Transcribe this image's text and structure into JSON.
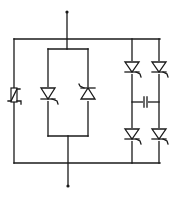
{
  "diagram": {
    "type": "circuit-schematic",
    "colors": {
      "line": "#1a1a1a",
      "background": "#ffffff"
    },
    "components": [
      {
        "id": "terminal-top",
        "kind": "terminal"
      },
      {
        "id": "terminal-bottom",
        "kind": "terminal"
      },
      {
        "id": "varistor",
        "kind": "varistor",
        "location": "left branch"
      },
      {
        "id": "thyristor-left",
        "kind": "thyristor",
        "orientation": "down"
      },
      {
        "id": "thyristor-right",
        "kind": "thyristor",
        "orientation": "up"
      },
      {
        "id": "bridge-thyristor-top-left",
        "kind": "thyristor",
        "orientation": "down"
      },
      {
        "id": "bridge-thyristor-top-right",
        "kind": "thyristor",
        "orientation": "down"
      },
      {
        "id": "bridge-thyristor-bottom-left",
        "kind": "thyristor",
        "orientation": "down"
      },
      {
        "id": "bridge-thyristor-bottom-right",
        "kind": "thyristor",
        "orientation": "down"
      },
      {
        "id": "capacitor",
        "kind": "capacitor",
        "location": "bridge mid-node"
      }
    ]
  }
}
